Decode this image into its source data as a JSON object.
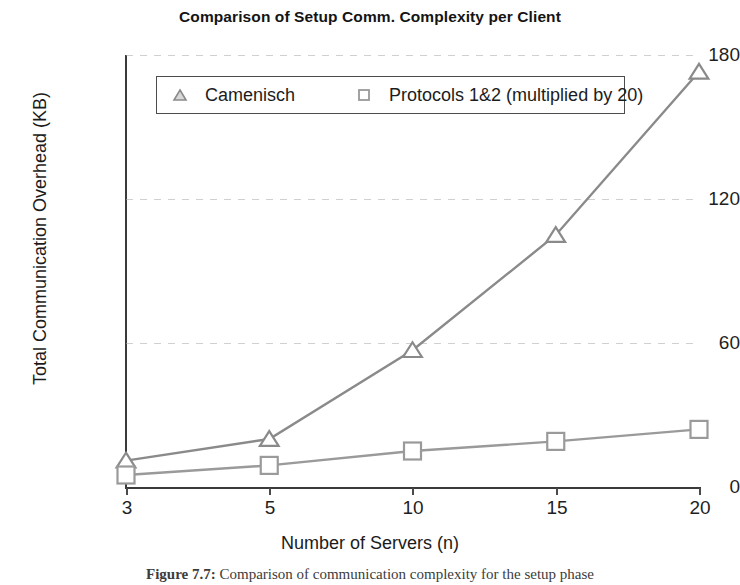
{
  "chart_data": {
    "type": "line",
    "title": "Comparison of Setup Comm. Complexity per Client",
    "xlabel": "Number of Servers (n)",
    "ylabel": "Total Communication Overhead (KB)",
    "categories": [
      "3",
      "5",
      "10",
      "15",
      "20"
    ],
    "x_is_categorical": true,
    "ylim": [
      0,
      180
    ],
    "yticks": [
      "0",
      "60",
      "120",
      "180"
    ],
    "ytick_values": [
      0,
      60,
      120,
      180
    ],
    "grid": "horizontal-dotted-faint",
    "legend_position": "top-inside",
    "series": [
      {
        "name": "Camenisch",
        "marker": "triangle",
        "color": "#8a8a8a",
        "values": [
          11,
          20,
          57,
          105,
          173
        ]
      },
      {
        "name": "Protocols 1&2 (multiplied by 20)",
        "marker": "square",
        "color": "#9a9a9a",
        "values": [
          5,
          9,
          15,
          19,
          24
        ]
      }
    ]
  },
  "legend": {
    "camenisch_label": "Camenisch",
    "protocols_label": "Protocols 1&2 (multiplied by 20)"
  },
  "caption": {
    "figure_number": "Figure 7.7:",
    "text": "Comparison of communication complexity for the setup phase"
  },
  "colors": {
    "axis": "#3a3a3a",
    "series_camenisch": "#8a8a8a",
    "series_protocols": "#9a9a9a",
    "grid": "#aaaaaf",
    "text": "#1a1a1a",
    "background": "#ffffff"
  }
}
